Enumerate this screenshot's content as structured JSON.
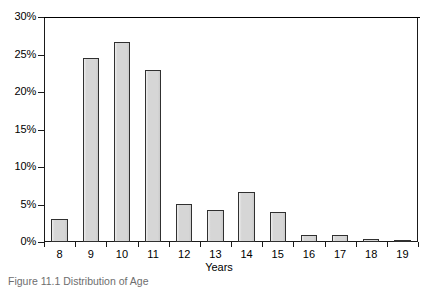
{
  "chart_data": {
    "type": "bar",
    "title": "",
    "subtitle": "",
    "xlabel": "Years",
    "ylabel": "",
    "categories": [
      "8",
      "9",
      "10",
      "11",
      "12",
      "13",
      "14",
      "15",
      "16",
      "17",
      "18",
      "19"
    ],
    "values": [
      3.1,
      24.5,
      26.7,
      22.9,
      5.1,
      4.3,
      6.7,
      4.0,
      0.9,
      1.0,
      0.4,
      0.15
    ],
    "value_format": "percent",
    "ylim": [
      0,
      30
    ],
    "yticks": [
      0,
      5,
      10,
      15,
      20,
      25,
      30
    ],
    "ytick_labels": [
      "0%",
      "5%",
      "10%",
      "15%",
      "20%",
      "25%",
      "30%"
    ],
    "xtick_labels": [
      "8",
      "9",
      "10",
      "11",
      "12",
      "13",
      "14",
      "15",
      "16",
      "17",
      "18",
      "19"
    ],
    "grid": false,
    "legend": null,
    "legend_position": "none",
    "series": [
      {
        "name": "Distribution of Age",
        "values": [
          3.1,
          24.5,
          26.7,
          22.9,
          5.1,
          4.3,
          6.7,
          4.0,
          0.9,
          1.0,
          0.4,
          0.15
        ]
      }
    ],
    "annotations": []
  },
  "figure": {
    "caption": "Figure 11.1  Distribution of Age",
    "bar_fill_color": "#d6d6d6",
    "bar_edge_color": "#303030",
    "axis_color": "#1a1a1a",
    "background_color": "#ffffff"
  }
}
